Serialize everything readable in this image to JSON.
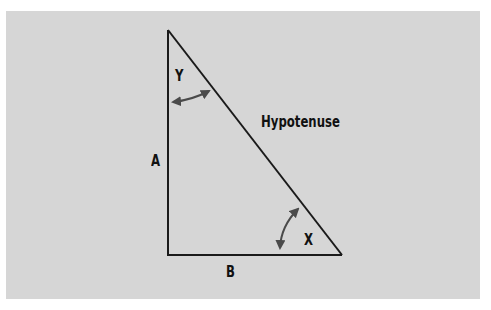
{
  "figure": {
    "background_color": "#d6d6d6",
    "line_color": "#1a1a1a",
    "arrow_color": "#4a4a4a",
    "labels": {
      "angle_y": "Y",
      "angle_x": "X",
      "side_a": "A",
      "side_b": "B",
      "hypotenuse": "Hypotenuse"
    },
    "vertices": {
      "top": [
        168,
        30
      ],
      "right_angle": [
        168,
        255
      ],
      "right": [
        342,
        255
      ]
    }
  }
}
